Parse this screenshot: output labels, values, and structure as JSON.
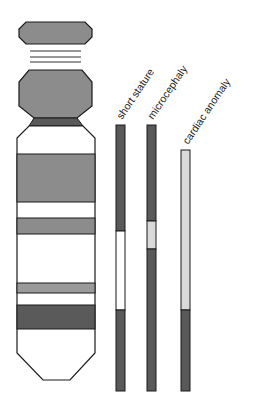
{
  "colors": {
    "outline": "#1a1a1a",
    "band_gray": "#8c8c8c",
    "band_light_gray": "#9a9a9a",
    "band_dark": "#5a5a5a",
    "bar_dark": "#595959",
    "bar_light": "#d9d9d9",
    "bar_white": "#ffffff"
  },
  "chromosome": {
    "satellite": "satellite",
    "stalk_lines": 3,
    "p_arm": "p-arm",
    "centromere": "centromere",
    "q_arm_bands": [
      {
        "y": 154,
        "h": 48,
        "shade": "gray"
      },
      {
        "y": 218,
        "h": 16,
        "shade": "gray"
      },
      {
        "y": 283,
        "h": 10,
        "shade": "light_gray"
      },
      {
        "y": 305,
        "h": 24,
        "shade": "dark"
      }
    ]
  },
  "phenotypes": [
    {
      "label": "short stature",
      "segments": [
        {
          "from": 125,
          "to": 231,
          "shade": "dark"
        },
        {
          "from": 231,
          "to": 310,
          "shade": "white"
        },
        {
          "from": 310,
          "to": 391,
          "shade": "dark"
        }
      ]
    },
    {
      "label": "microcephaly",
      "segments": [
        {
          "from": 125,
          "to": 221,
          "shade": "dark"
        },
        {
          "from": 221,
          "to": 249,
          "shade": "light"
        },
        {
          "from": 249,
          "to": 391,
          "shade": "dark"
        }
      ]
    },
    {
      "label": "cardiac anomaly",
      "segments": [
        {
          "from": 150,
          "to": 310,
          "shade": "light"
        },
        {
          "from": 310,
          "to": 391,
          "shade": "dark"
        }
      ]
    }
  ]
}
